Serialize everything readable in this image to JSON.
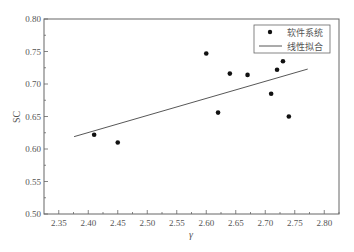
{
  "chart_data": {
    "type": "scatter",
    "title": "",
    "xlabel": "γ",
    "ylabel": "SC",
    "xlim": [
      2.325,
      2.825
    ],
    "ylim": [
      0.5,
      0.8
    ],
    "xticks": [
      "2.35",
      "2.40",
      "2.45",
      "2.50",
      "2.55",
      "2.60",
      "2.65",
      "2.70",
      "2.75",
      "2.80"
    ],
    "yticks": [
      "0.50",
      "0.55",
      "0.60",
      "0.65",
      "0.70",
      "0.75",
      "0.80"
    ],
    "grid": false,
    "legend_position": "upper right",
    "series": [
      {
        "name": "软件系统",
        "kind": "scatter",
        "marker": "filled-circle",
        "color": "#111111",
        "points": [
          {
            "x": 2.41,
            "y": 0.622
          },
          {
            "x": 2.45,
            "y": 0.61
          },
          {
            "x": 2.6,
            "y": 0.747
          },
          {
            "x": 2.62,
            "y": 0.656
          },
          {
            "x": 2.64,
            "y": 0.716
          },
          {
            "x": 2.67,
            "y": 0.714
          },
          {
            "x": 2.71,
            "y": 0.685
          },
          {
            "x": 2.72,
            "y": 0.722
          },
          {
            "x": 2.73,
            "y": 0.735
          },
          {
            "x": 2.74,
            "y": 0.65
          }
        ]
      },
      {
        "name": "线性拟合",
        "kind": "line",
        "color": "#444444",
        "points": [
          {
            "x": 2.376,
            "y": 0.619
          },
          {
            "x": 2.772,
            "y": 0.723
          }
        ]
      }
    ]
  },
  "legend": {
    "items": [
      {
        "label": "软件系统",
        "symbol": "dot"
      },
      {
        "label": "线性拟合",
        "symbol": "line"
      }
    ]
  },
  "axes": {
    "x_title": "γ",
    "y_title": "SC"
  }
}
